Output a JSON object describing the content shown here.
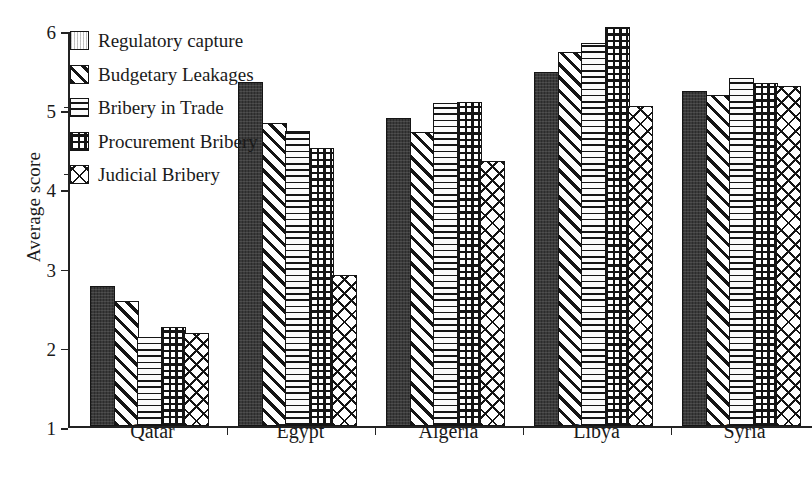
{
  "chart_data": {
    "type": "bar",
    "title": "",
    "xlabel": "",
    "ylabel": "Average score",
    "ylim": [
      1,
      6
    ],
    "yticks": [
      1,
      2,
      3,
      4,
      5,
      6
    ],
    "grid": false,
    "legend_position": "top-left",
    "categories": [
      "Qatar",
      "Egypt",
      "Algeria",
      "Libya",
      "Syria"
    ],
    "series": [
      {
        "name": "Regulatory capture",
        "pattern": "solid-dark",
        "values": [
          2.77,
          5.35,
          4.9,
          5.47,
          5.23
        ]
      },
      {
        "name": "Budgetary Leakages",
        "pattern": "diagonal-hatch",
        "values": [
          2.58,
          4.83,
          4.72,
          5.73,
          5.19
        ]
      },
      {
        "name": "Bribery in Trade",
        "pattern": "horizontal-lines",
        "values": [
          2.13,
          4.73,
          5.08,
          5.84,
          5.4
        ]
      },
      {
        "name": "Procurement Bribery",
        "pattern": "square-grid",
        "values": [
          2.26,
          4.52,
          5.09,
          6.04,
          5.34
        ]
      },
      {
        "name": "Judicial Bribery",
        "pattern": "crosshatch",
        "values": [
          2.18,
          2.91,
          4.35,
          5.05,
          5.3
        ]
      }
    ]
  },
  "axis": {
    "y_title": "Average score",
    "y_tick_labels": [
      "6",
      "5",
      "4",
      "3",
      "2",
      "1"
    ],
    "x_tick_labels": [
      "Qatar",
      "Egypt",
      "Algeria",
      "Libya",
      "Syria"
    ]
  },
  "legend": {
    "items": [
      {
        "label": "Regulatory capture"
      },
      {
        "label": "Budgetary Leakages"
      },
      {
        "label": "Bribery in Trade"
      },
      {
        "label": "Procurement Bribery"
      },
      {
        "label": "Judicial Bribery"
      }
    ]
  },
  "caption": {
    "text": ""
  }
}
